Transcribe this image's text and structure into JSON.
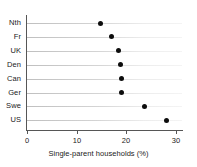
{
  "chart_data": {
    "type": "scatter",
    "orientation": "horizontal",
    "title": "",
    "xlabel": "Single-parent households (%)",
    "ylabel": "",
    "xlim": [
      0,
      30
    ],
    "xticks": [
      0,
      10,
      20,
      30
    ],
    "xtick_labels": [
      "0",
      "10",
      "20",
      "30"
    ],
    "grid": "horizontal",
    "legend": "none",
    "marker": "filled-circle",
    "marker_color": "#0d0d0d",
    "grid_color": "#c8c8c8",
    "axis_color": "#565656",
    "background": "#ffffff",
    "categories": [
      "Nth",
      "Fr",
      "UK",
      "Den",
      "Can",
      "Ger",
      "Swe",
      "US"
    ],
    "values": [
      14.7,
      17.1,
      18.4,
      18.9,
      19.1,
      19.1,
      23.7,
      28.0
    ],
    "points": [
      {
        "category": "Nth",
        "value": 14.7
      },
      {
        "category": "Fr",
        "value": 17.1
      },
      {
        "category": "UK",
        "value": 18.4
      },
      {
        "category": "Den",
        "value": 18.9
      },
      {
        "category": "Can",
        "value": 19.1
      },
      {
        "category": "Ger",
        "value": 19.1
      },
      {
        "category": "Swe",
        "value": 23.7
      },
      {
        "category": "US",
        "value": 28.0
      }
    ]
  }
}
